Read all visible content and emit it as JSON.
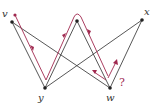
{
  "diagram": {
    "type": "graph",
    "vertices": [
      {
        "id": "v",
        "label": "v",
        "x": 12,
        "y": 22
      },
      {
        "id": "t",
        "label": "",
        "x": 77,
        "y": 21
      },
      {
        "id": "x",
        "label": "x",
        "x": 142,
        "y": 20
      },
      {
        "id": "y",
        "label": "y",
        "x": 45,
        "y": 88
      },
      {
        "id": "w",
        "label": "w",
        "x": 110,
        "y": 88
      }
    ],
    "edges": [
      [
        "v",
        "y"
      ],
      [
        "v",
        "w"
      ],
      [
        "y",
        "t"
      ],
      [
        "t",
        "w"
      ],
      [
        "y",
        "x"
      ],
      [
        "x",
        "w"
      ]
    ],
    "path": {
      "color": "#a0294f",
      "description": "walk v → y → top → w, then choice at w",
      "question_mark": "?"
    },
    "colors": {
      "edge": "#444444",
      "vertex": "#222222",
      "path": "#a0294f"
    }
  }
}
